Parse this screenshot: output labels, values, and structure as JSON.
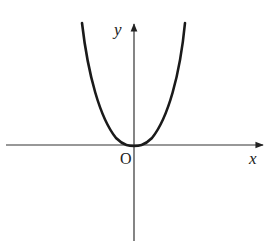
{
  "diagram": {
    "type": "function-graph",
    "curve": {
      "shape": "U-shaped, flat-bottomed, symmetric about y-axis",
      "vertex": [
        0,
        0
      ]
    },
    "axes": {
      "x_label": "x",
      "y_label": "y",
      "origin_label": "O"
    },
    "colors": {
      "stroke": "#222222",
      "background": "#ffffff"
    }
  }
}
